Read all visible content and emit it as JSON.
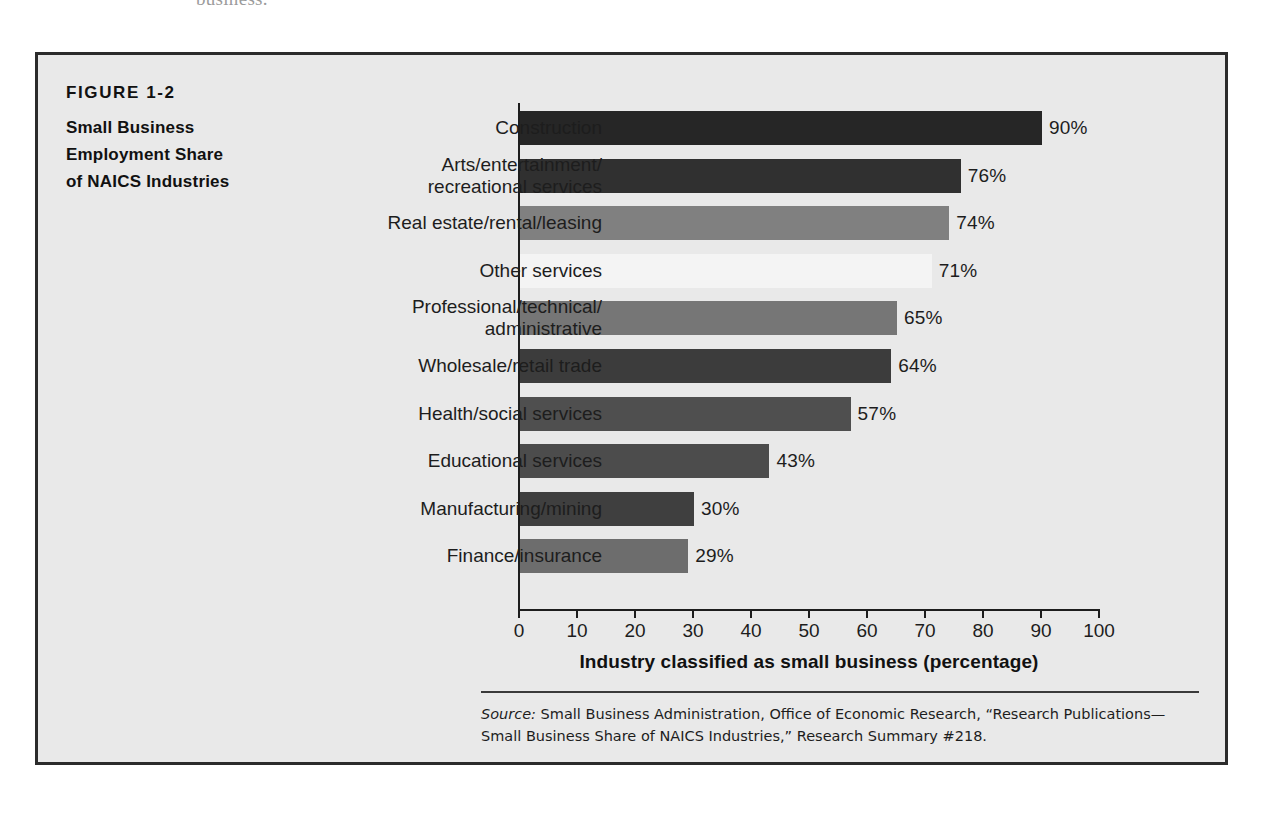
{
  "page_top_text": "business.",
  "figure": {
    "number": "FIGURE 1-2",
    "caption_lines": [
      "Small Business",
      "Employment Share",
      "of NAICS Industries"
    ],
    "source_prefix": "Source:",
    "source_text": " Small Business Administration, Office of Economic Research, “Research Publications—Small Business Share of NAICS Industries,” Research Summary #218."
  },
  "chart_data": {
    "type": "bar",
    "orientation": "horizontal",
    "title": "Small Business Employment Share of NAICS Industries",
    "xlabel": "Industry classified as small business (percentage)",
    "ylabel": "",
    "xlim": [
      0,
      100
    ],
    "xticks": [
      0,
      10,
      20,
      30,
      40,
      50,
      60,
      70,
      80,
      90,
      100
    ],
    "xtick_labels": [
      "0",
      "10",
      "20",
      "30",
      "40",
      "50",
      "60",
      "70",
      "80",
      "90",
      "100"
    ],
    "grid": false,
    "legend": "none",
    "categories": [
      "Construction",
      "Arts/entertainment/ recreational services",
      "Real estate/rental/leasing",
      "Other services",
      "Professional/technical/ administrative",
      "Wholesale/retail trade",
      "Health/social services",
      "Educational services",
      "Manufacturing/mining",
      "Finance/insurance"
    ],
    "values": [
      90,
      76,
      74,
      71,
      65,
      64,
      57,
      43,
      30,
      29
    ],
    "value_labels": [
      "90%",
      "76%",
      "74%",
      "71%",
      "65%",
      "64%",
      "57%",
      "43%",
      "30%",
      "29%"
    ],
    "bar_colors": [
      "#262626",
      "#303030",
      "#808080",
      "#f4f4f4",
      "#767676",
      "#3c3c3c",
      "#4f4f4f",
      "#4c4c4c",
      "#3f3f3f",
      "#6d6d6d"
    ],
    "bars": [
      {
        "label_lines": [
          "Construction"
        ],
        "value": 90,
        "value_label": "90%",
        "color": "#262626"
      },
      {
        "label_lines": [
          "Arts/entertainment/",
          "recreational services"
        ],
        "value": 76,
        "value_label": "76%",
        "color": "#303030"
      },
      {
        "label_lines": [
          "Real estate/rental/leasing"
        ],
        "value": 74,
        "value_label": "74%",
        "color": "#808080"
      },
      {
        "label_lines": [
          "Other services"
        ],
        "value": 71,
        "value_label": "71%",
        "color": "#f4f4f4"
      },
      {
        "label_lines": [
          "Professional/technical/",
          "administrative"
        ],
        "value": 65,
        "value_label": "65%",
        "color": "#767676"
      },
      {
        "label_lines": [
          "Wholesale/retail trade"
        ],
        "value": 64,
        "value_label": "64%",
        "color": "#3c3c3c"
      },
      {
        "label_lines": [
          "Health/social services"
        ],
        "value": 57,
        "value_label": "57%",
        "color": "#4f4f4f"
      },
      {
        "label_lines": [
          "Educational services"
        ],
        "value": 43,
        "value_label": "43%",
        "color": "#4c4c4c"
      },
      {
        "label_lines": [
          "Manufacturing/mining"
        ],
        "value": 30,
        "value_label": "30%",
        "color": "#3f3f3f"
      },
      {
        "label_lines": [
          "Finance/insurance"
        ],
        "value": 29,
        "value_label": "29%",
        "color": "#6d6d6d"
      }
    ]
  },
  "colors": {
    "frame_border": "#2b2b2b",
    "frame_background": "#e9e9e9",
    "axis": "#1d1d1d",
    "text": "#1d1d1d"
  }
}
